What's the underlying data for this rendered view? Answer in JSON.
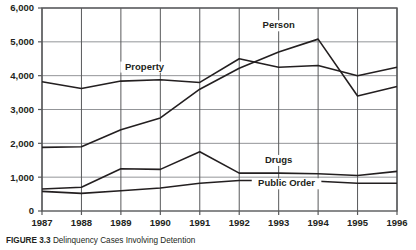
{
  "caption": {
    "figure_number": "FIGURE 3.3",
    "text": "Delinquency Cases Involving Detention"
  },
  "chart_data": {
    "type": "line",
    "title": "",
    "xlabel": "",
    "ylabel": "",
    "x": [
      1987,
      1988,
      1989,
      1990,
      1991,
      1992,
      1993,
      1994,
      1995,
      1996
    ],
    "categories": [
      "1987",
      "1988",
      "1989",
      "1990",
      "1991",
      "1992",
      "1993",
      "1994",
      "1995",
      "1996"
    ],
    "ylim": [
      0,
      6000
    ],
    "yticks": [
      0,
      1000,
      2000,
      3000,
      4000,
      5000,
      6000
    ],
    "ytick_labels": [
      "0",
      "1,000",
      "2,000",
      "3,000",
      "4,000",
      "5,000",
      "6,000"
    ],
    "grid": true,
    "legend_position": "inline-labels",
    "line_color": "#231f20",
    "grid_color": "#939598",
    "axis_color": "#58595b",
    "series": [
      {
        "name": "Property",
        "values": [
          3820,
          3620,
          3840,
          3880,
          3800,
          4500,
          4250,
          4300,
          4000,
          4250
        ],
        "label_x": 1989.6,
        "label_y": 4180
      },
      {
        "name": "Person",
        "values": [
          1880,
          1900,
          2400,
          2750,
          3600,
          4220,
          4700,
          5080,
          3400,
          3680
        ],
        "label_x": 1993.0,
        "label_y": 5400
      },
      {
        "name": "Drugs",
        "values": [
          650,
          700,
          1250,
          1230,
          1750,
          1120,
          1120,
          1100,
          1050,
          1170
        ],
        "label_x": 1993.0,
        "label_y": 1420
      },
      {
        "name": "Public Order",
        "values": [
          580,
          520,
          600,
          680,
          820,
          900,
          900,
          880,
          820,
          820
        ],
        "label_x": 1993.2,
        "label_y": 730
      }
    ]
  }
}
